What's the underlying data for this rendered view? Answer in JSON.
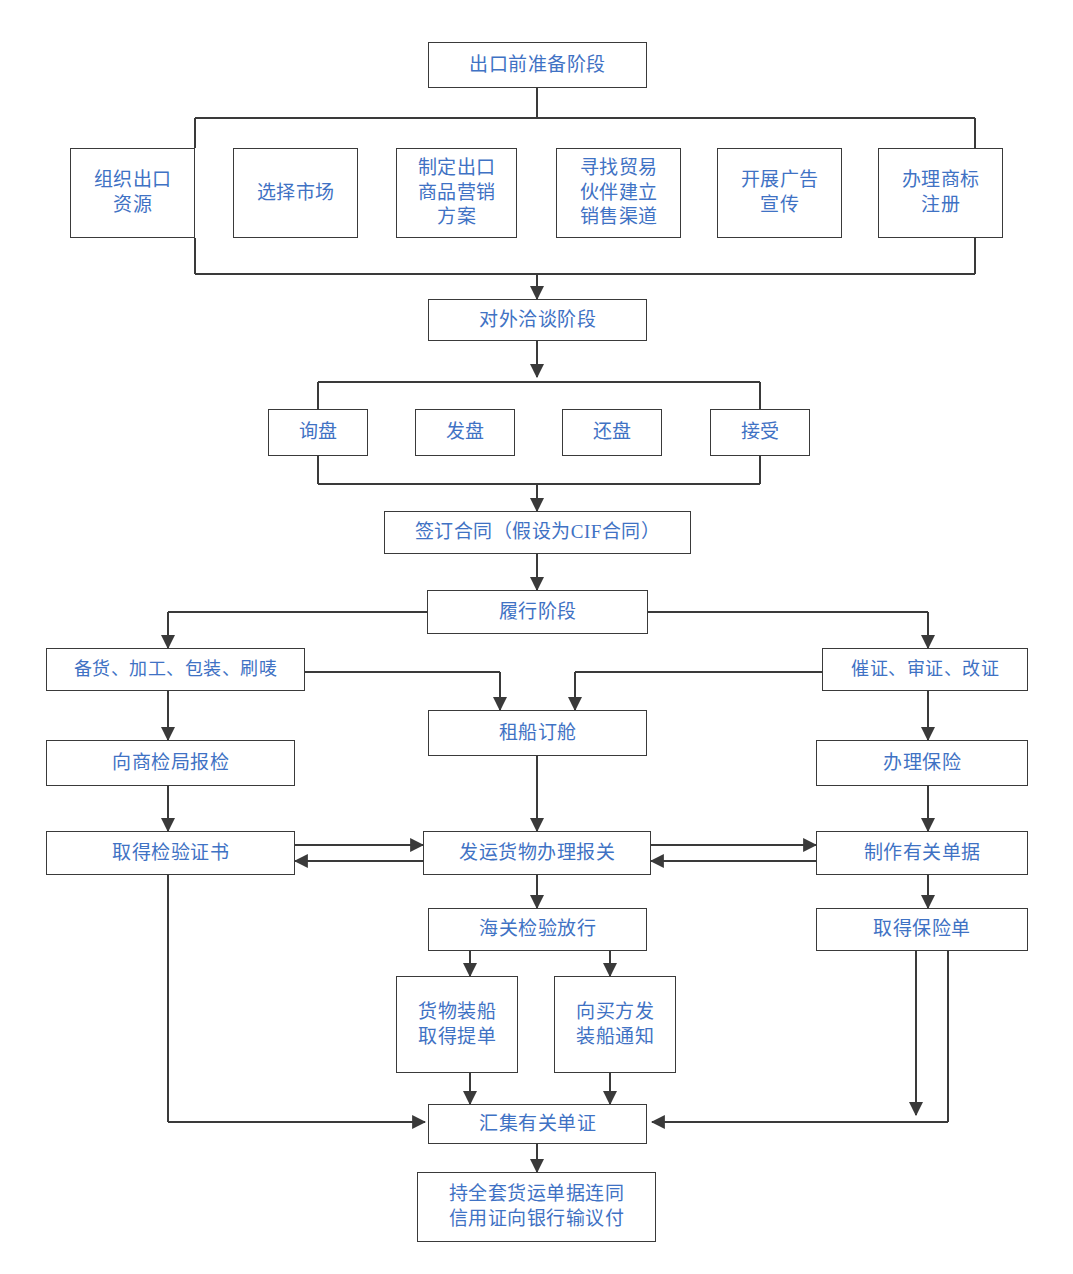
{
  "diagram": {
    "text_color": "#3f72c4",
    "border_color": "#3a3a3a",
    "background": "#ffffff",
    "nodes": {
      "pre_export": "出口前准备阶段",
      "organize_resources": "组织出口\n资源",
      "select_market": "选择市场",
      "marketing_plan": "制定出口\n商品营销\n方案",
      "find_partners": "寻找贸易\n伙伴建立\n销售渠道",
      "advertising": "开展广告\n宣传",
      "trademark": "办理商标\n注册",
      "negotiation_stage": "对外洽谈阶段",
      "inquiry": "询盘",
      "offer": "发盘",
      "counter_offer": "还盘",
      "acceptance": "接受",
      "sign_contract": "签订合同（假设为CIF合同）",
      "performance_stage": "履行阶段",
      "prepare_goods": "备货、加工、包装、刷唛",
      "urge_lc": "催证、审证、改证",
      "charter_booking": "租船订舱",
      "apply_inspection": "向商检局报检",
      "arrange_insurance": "办理保险",
      "inspection_certificate": "取得检验证书",
      "ship_customs": "发运货物办理报关",
      "prepare_documents": "制作有关单据",
      "customs_release": "海关检验放行",
      "insurance_policy": "取得保险单",
      "load_bill_lading": "货物装船\n取得提单",
      "shipping_advice": "向买方发\n装船通知",
      "collect_documents": "汇集有关单证",
      "bank_negotiation": "持全套货运单据连同\n信用证向银行输议付"
    }
  }
}
